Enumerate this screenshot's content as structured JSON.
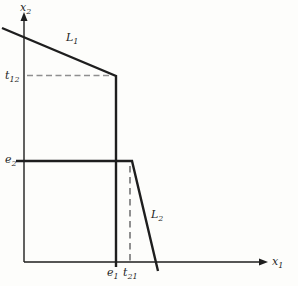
{
  "figure": {
    "background": "#fdfdfb",
    "ink_color": "#1e1e1e",
    "axis_stroke_width": 1.4,
    "curve_stroke_width": 2.4,
    "axes": {
      "y": {
        "x": 24,
        "y_start": 262,
        "y_end": 21,
        "arrow_tip_y": 12,
        "label": {
          "main": "x",
          "sub": "2",
          "x": 20,
          "y": 11
        }
      },
      "x": {
        "y": 262,
        "x_start": 24,
        "x_end": 259,
        "arrow_tip_x": 268,
        "label": {
          "main": "x",
          "sub": "1",
          "x": 272,
          "y": 265
        }
      }
    },
    "polylines": [
      {
        "name": "line-L1",
        "points": [
          [
            2,
            28
          ],
          [
            116,
            76
          ],
          [
            116,
            267
          ]
        ]
      },
      {
        "name": "line-e2-L2",
        "points": [
          [
            16,
            161
          ],
          [
            132,
            161
          ],
          [
            158,
            271
          ]
        ]
      }
    ],
    "dashed_lines": [
      {
        "name": "dashed-line-t12",
        "x1": 27,
        "y1": 75.5,
        "x2": 112,
        "y2": 75.5,
        "color": "#8f8f8f",
        "dash": "6 3.5",
        "width": 1.3
      },
      {
        "name": "dashed-line-t21",
        "x1": 130,
        "y1": 166,
        "x2": 130,
        "y2": 261,
        "color": "#565656",
        "dash": "6.5 4.5",
        "width": 1.3
      }
    ],
    "labels": [
      {
        "name": "label-L1",
        "main": "L",
        "sub": "1",
        "x": 66,
        "y": 41
      },
      {
        "name": "label-L2",
        "main": "L",
        "sub": "2",
        "x": 151,
        "y": 218
      },
      {
        "name": "label-t12",
        "main": "t",
        "sub": "12",
        "x": 5,
        "y": 79
      },
      {
        "name": "label-e2",
        "main": "e",
        "sub": "2",
        "x": 5,
        "y": 163
      },
      {
        "name": "label-e1",
        "main": "e",
        "sub": "1",
        "x": 107,
        "y": 276
      },
      {
        "name": "label-t21",
        "main": "t",
        "sub": "21",
        "x": 123,
        "y": 276
      }
    ]
  }
}
